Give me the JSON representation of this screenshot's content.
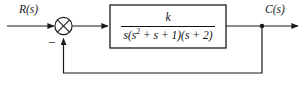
{
  "diagram": {
    "type": "control-system-block-diagram",
    "background_color": "#ffffff",
    "line_color": "#1a1a1a",
    "text_color": "#111111",
    "input_label": "R(s)",
    "output_label": "C(s)",
    "summing_junction": {
      "name": "summing-junction",
      "style": "circle-with-cross",
      "feedback_sign": "−",
      "input_sign": ""
    },
    "plant_block": {
      "name": "transfer-function-block",
      "numerator": "k",
      "denominator_prefix": "s(s",
      "denominator_exponent": "2",
      "denominator_suffix": " + s + 1)(s + 2)",
      "transfer_function": "k / (s(s^2 + s + 1)(s + 2))"
    },
    "feedback_path": {
      "name": "feedback-path",
      "gain": "1",
      "description": "unity feedback from output takeoff node to summing junction"
    },
    "takeoff_node": {
      "name": "output-takeoff-node"
    }
  }
}
